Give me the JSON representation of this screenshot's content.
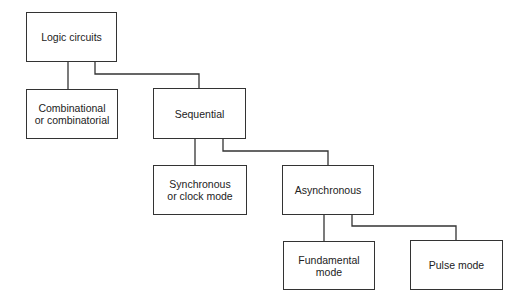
{
  "diagram": {
    "type": "hierarchy",
    "nodes": [
      {
        "id": "logic",
        "label": "Logic circuits"
      },
      {
        "id": "comb",
        "label": "Combinational\nor combinatorial"
      },
      {
        "id": "seq",
        "label": "Sequential"
      },
      {
        "id": "sync",
        "label": "Synchronous\nor clock mode"
      },
      {
        "id": "async",
        "label": "Asynchronous"
      },
      {
        "id": "fund",
        "label": "Fundamental\nmode"
      },
      {
        "id": "pulse",
        "label": "Pulse mode"
      }
    ],
    "edges": [
      [
        "logic",
        "comb"
      ],
      [
        "logic",
        "seq"
      ],
      [
        "seq",
        "sync"
      ],
      [
        "seq",
        "async"
      ],
      [
        "async",
        "fund"
      ],
      [
        "async",
        "pulse"
      ]
    ]
  }
}
